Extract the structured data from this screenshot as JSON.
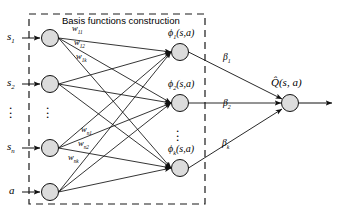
{
  "figure": {
    "type": "neural-network-diagram",
    "title": "Basis functions construction",
    "background_color": "#ffffff",
    "stroke_color": "#1a1a1a",
    "node_fill_color": "#d9d9d9"
  },
  "group_box": {
    "label": "Basis functions construction",
    "style": "dashed",
    "x": 29,
    "y": 14,
    "width": 176,
    "height": 190
  },
  "input_layer": {
    "name": "input-layer",
    "nodes": [
      {
        "id": "s1",
        "label": "s",
        "subscript": "1",
        "cx": 50,
        "cy": 38,
        "r": 8.5
      },
      {
        "id": "s2",
        "label": "s",
        "subscript": "2",
        "cx": 50,
        "cy": 84,
        "r": 8.5
      },
      {
        "id": "sn",
        "label": "s",
        "subscript": "n",
        "cx": 50,
        "cy": 148,
        "r": 8.5
      },
      {
        "id": "a",
        "label": "a",
        "subscript": "",
        "cx": 50,
        "cy": 192,
        "r": 8.5
      }
    ],
    "ellipsis": {
      "x": 50,
      "y": 105
    },
    "external_labels": [
      {
        "text": "s",
        "sub": "1",
        "x": 8,
        "y": 32
      },
      {
        "text": "s",
        "sub": "2",
        "x": 8,
        "y": 78
      },
      {
        "text": "s",
        "sub": "n",
        "x": 8,
        "y": 142
      },
      {
        "text": "a",
        "sub": "",
        "x": 10,
        "y": 186
      }
    ],
    "label_ellipsis": {
      "x": 14,
      "y": 105
    }
  },
  "hidden_layer": {
    "name": "basis-function-layer",
    "nodes": [
      {
        "id": "phi1",
        "label": "ϕ",
        "subscript": "1",
        "args": "(s, a)",
        "cx": 180,
        "cy": 52,
        "r": 8.5
      },
      {
        "id": "phi2",
        "label": "ϕ",
        "subscript": "2",
        "args": "(s, a)",
        "cx": 180,
        "cy": 103,
        "r": 8.5
      },
      {
        "id": "phik",
        "label": "ϕ",
        "subscript": "k",
        "args": "(s, a)",
        "cx": 180,
        "cy": 168,
        "r": 8.5
      }
    ],
    "ellipsis": {
      "x": 180,
      "y": 128
    }
  },
  "output_layer": {
    "name": "output-layer",
    "node": {
      "id": "q",
      "cx": 290,
      "cy": 103,
      "r": 8.5
    },
    "label": "Q̂(s, a)",
    "label_x": 272,
    "label_y": 78
  },
  "weights": {
    "input_to_hidden": [
      {
        "text": "w",
        "sub": "11",
        "x": 72,
        "y": 28
      },
      {
        "text": "w",
        "sub": "12",
        "x": 72,
        "y": 42
      },
      {
        "text": "w",
        "sub": "1k",
        "x": 72,
        "y": 56
      },
      {
        "text": "w",
        "sub": "n1",
        "x": 75,
        "y": 129
      },
      {
        "text": "w",
        "sub": "n2",
        "x": 75,
        "y": 143
      },
      {
        "text": "w",
        "sub": "nk",
        "x": 68,
        "y": 157
      }
    ],
    "hidden_to_output": [
      {
        "text": "β",
        "sub": "1",
        "x": 224,
        "y": 58
      },
      {
        "text": "β",
        "sub": "2",
        "x": 224,
        "y": 104
      },
      {
        "text": "β",
        "sub": "k",
        "x": 224,
        "y": 144
      }
    ]
  },
  "edges": {
    "input_arrow_sources_x": 28,
    "output_arrow_target_x": 332
  }
}
